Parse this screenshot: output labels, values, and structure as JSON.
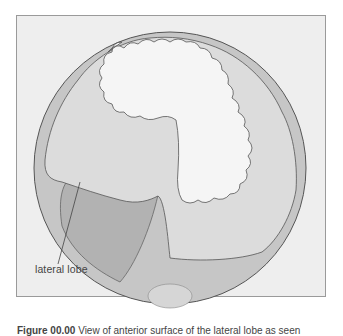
{
  "figure": {
    "label_lateral_lobe": "lateral lobe",
    "caption_number": "Figure 00.00",
    "caption_text": "View of anterior surface of the lateral lobe as seen"
  },
  "colors": {
    "frame_bg": "#eeeeee",
    "frame_border": "#9a9a9a",
    "circle_fill": "#c4c4c4",
    "lobe_fill": "#b3b3b3",
    "fold_fill": "#dadada",
    "center_fill": "#f4f4f4",
    "outline": "#555555"
  }
}
